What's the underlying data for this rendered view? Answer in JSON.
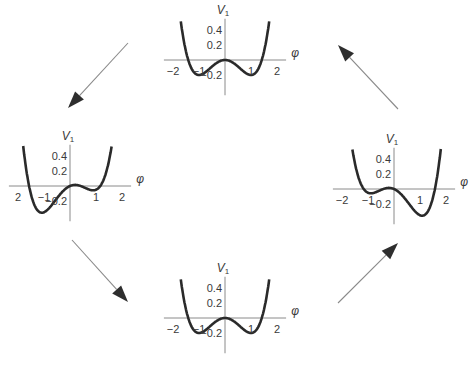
{
  "diagram": {
    "y_axis_label": "V",
    "y_axis_subscript": "1",
    "x_axis_label": "φ",
    "panels": [
      {
        "id": "top",
        "tilt": 0.0,
        "description": "symmetric double well",
        "x_ticks": [
          "−2",
          "−1",
          "1",
          "2"
        ],
        "y_ticks": [
          "0.4",
          "0.2",
          "−0.2"
        ],
        "potential": {
          "a": 0.2,
          "b": 0.4,
          "c": 0.0
        }
      },
      {
        "id": "left",
        "tilt": 0.15,
        "description": "double well tilted, left minimum deeper",
        "x_ticks": [
          "2",
          "−1",
          "1",
          "2"
        ],
        "y_ticks": [
          "0.4",
          "0.2",
          "−0.2"
        ],
        "potential": {
          "a": 0.2,
          "b": 0.4,
          "c": 0.15
        }
      },
      {
        "id": "right",
        "tilt": -0.15,
        "description": "double well tilted, right minimum deeper",
        "x_ticks": [
          "−2",
          "−1",
          "1",
          "2"
        ],
        "y_ticks": [
          "0.4",
          "0.2",
          "−0.2"
        ],
        "potential": {
          "a": 0.2,
          "b": 0.4,
          "c": -0.15
        }
      },
      {
        "id": "bottom",
        "tilt": 0.0,
        "description": "symmetric double well",
        "x_ticks": [
          "−2",
          "−1",
          "1",
          "2"
        ],
        "y_ticks": [
          "0.4",
          "0.2",
          "−0.2"
        ],
        "potential": {
          "a": 0.2,
          "b": 0.4,
          "c": 0.0
        }
      }
    ],
    "arrows": [
      {
        "from": "top",
        "to": "left"
      },
      {
        "from": "left",
        "to": "bottom"
      },
      {
        "from": "bottom",
        "to": "right"
      },
      {
        "from": "right",
        "to": "top"
      }
    ]
  }
}
